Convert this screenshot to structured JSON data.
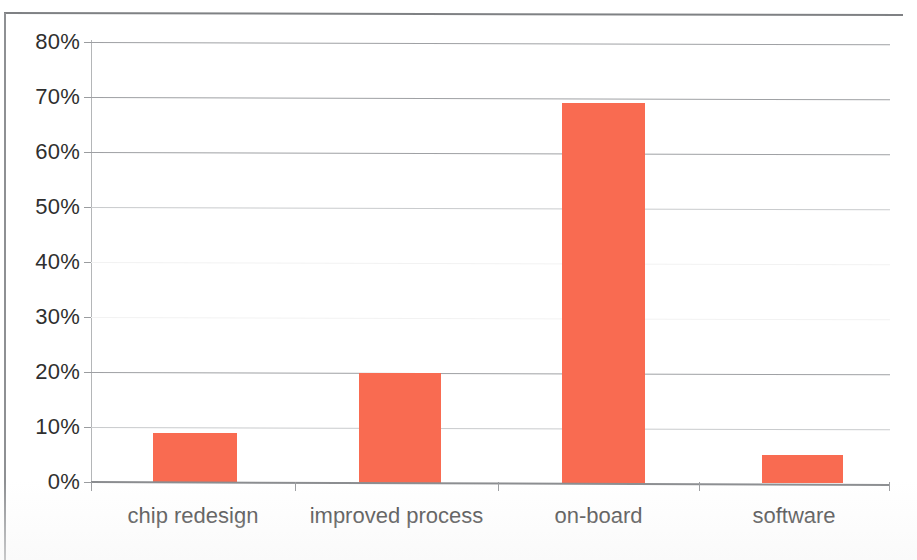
{
  "chart_data": {
    "type": "bar",
    "title": "",
    "subtitle": "",
    "xlabel": "",
    "ylabel": "",
    "categories": [
      "chip redesign",
      "improved process",
      "on-board",
      "software"
    ],
    "values": [
      9,
      20,
      69,
      5
    ],
    "value_labels": [
      "9%",
      "20%",
      "69%",
      "5%"
    ],
    "series": [
      {
        "name": "",
        "values": [
          9,
          20,
          69,
          5
        ],
        "color": "#f96b51"
      }
    ],
    "ylim": [
      0,
      80
    ],
    "y_tick_values": [
      0,
      10,
      20,
      30,
      40,
      50,
      60,
      70,
      80
    ],
    "y_tick_labels": [
      "0%",
      "10%",
      "20%",
      "30%",
      "40%",
      "50%",
      "60%",
      "70%",
      "80%"
    ],
    "y_tick_format": "percent",
    "grid": {
      "horizontal": true,
      "vertical": false,
      "color": "#9fa1a4"
    },
    "legend": {
      "visible": false,
      "position": "none",
      "entries": []
    },
    "annotations": [],
    "colors": {
      "bar": "#f96b51",
      "gridline": "#9fa1a4",
      "axis": "#8b8d90",
      "text": "#2f2f2f",
      "background": "#ffffff"
    }
  }
}
